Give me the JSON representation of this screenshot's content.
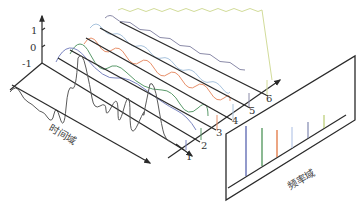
{
  "diagram": {
    "amplitude_axis": {
      "ticks": [
        {
          "label": "1",
          "value": 1
        },
        {
          "label": "0",
          "value": 0
        },
        {
          "label": "-1",
          "value": -1
        }
      ]
    },
    "depth_axis": {
      "labels": [
        "1",
        "2",
        "3",
        "4",
        "5",
        "6"
      ]
    },
    "time_domain_label": "时间域",
    "frequency_domain_label": "频率域",
    "components": [
      {
        "index": 1,
        "color": "#6f79b8",
        "name": "blue component"
      },
      {
        "index": 2,
        "color": "#4f8f5a",
        "name": "green component"
      },
      {
        "index": 3,
        "color": "#e07a4a",
        "name": "orange component"
      },
      {
        "index": 4,
        "color": "#a9c4de",
        "name": "light-blue component"
      },
      {
        "index": 5,
        "color": "#8a8aa8",
        "name": "grey-blue component"
      },
      {
        "index": 6,
        "color": "#c8d48a",
        "name": "yellow-green component"
      }
    ],
    "sum_wave_color": "#555555",
    "spectrum_lines": [
      {
        "index": 1,
        "color": "#4a57a8",
        "height": 1.0
      },
      {
        "index": 2,
        "color": "#3f8a4a",
        "height": 0.82
      },
      {
        "index": 3,
        "color": "#e06a30",
        "height": 0.72
      },
      {
        "index": 4,
        "color": "#b8c8e8",
        "height": 0.62
      },
      {
        "index": 5,
        "color": "#8088b0",
        "height": 0.52
      },
      {
        "index": 6,
        "color": "#b8cc70",
        "height": 0.42
      }
    ]
  }
}
